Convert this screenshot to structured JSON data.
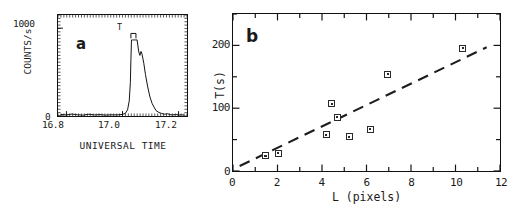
{
  "figure": {
    "background": "#ffffff",
    "ink": "#1a1a1a"
  },
  "panel_a": {
    "letter": "a",
    "peak_marker_label": "T",
    "axis_title_y": "COUNTS/s",
    "axis_title_x": "UNIVERSAL TIME",
    "ytick_labels": [
      "0",
      "1000"
    ],
    "xtick_labels": [
      "16.8",
      "17.0",
      "17.2"
    ],
    "chart_data": {
      "type": "line",
      "title": "",
      "xlabel": "UNIVERSAL TIME",
      "ylabel": "COUNTS/s",
      "xlim": [
        16.77,
        17.23
      ],
      "ylim": [
        0,
        1150
      ],
      "xticks": [
        16.8,
        17.0,
        17.2
      ],
      "yticks": [
        0,
        1000
      ],
      "grid": false,
      "legend": "none",
      "annotations": [
        {
          "text": "T",
          "x": 17.04,
          "y": 990,
          "note": "bracket spanning flat-topped burst"
        }
      ],
      "series": [
        {
          "name": "count rate",
          "note": "noisy baseline with sharp flat-topped step and smooth secondary peak",
          "x": [
            16.78,
            16.8,
            16.82,
            16.84,
            16.86,
            16.88,
            16.9,
            16.92,
            16.94,
            16.96,
            16.98,
            17.0,
            17.01,
            17.018,
            17.024,
            17.028,
            17.03,
            17.032,
            17.036,
            17.04,
            17.046,
            17.052,
            17.058,
            17.062,
            17.066,
            17.07,
            17.076,
            17.082,
            17.09,
            17.098,
            17.106,
            17.114,
            17.12,
            17.13,
            17.14,
            17.15,
            17.16,
            17.17,
            17.18,
            17.19,
            17.2,
            17.21,
            17.22
          ],
          "y": [
            18,
            12,
            22,
            14,
            10,
            20,
            12,
            16,
            10,
            14,
            12,
            18,
            30,
            70,
            170,
            380,
            640,
            866,
            866,
            866,
            866,
            866,
            730,
            690,
            735,
            700,
            600,
            470,
            330,
            215,
            140,
            92,
            60,
            40,
            28,
            20,
            26,
            16,
            12,
            18,
            10,
            14,
            10
          ]
        }
      ]
    }
  },
  "panel_b": {
    "letter": "b",
    "axis_title_y": "T(s)",
    "axis_title_x": "L (pixels)",
    "ytick_labels": [
      "0",
      "100",
      "200"
    ],
    "xtick_labels": [
      "0",
      "2",
      "4",
      "6",
      "8",
      "10",
      "12"
    ],
    "chart_data": {
      "type": "scatter",
      "title": "",
      "xlabel": "L (pixels)",
      "ylabel": "T(s)",
      "xlim": [
        0,
        12
      ],
      "ylim": [
        0,
        250
      ],
      "xticks": [
        0,
        2,
        4,
        6,
        8,
        10,
        12
      ],
      "yticks": [
        0,
        100,
        200
      ],
      "minor_xticks": [
        1,
        3,
        5,
        7,
        9,
        11
      ],
      "minor_yticks": [
        50,
        150,
        250
      ],
      "grid": false,
      "legend": "none",
      "marker_style": "open-square-with-center-dot",
      "points": [
        {
          "x": 1.45,
          "y": 27
        },
        {
          "x": 2.02,
          "y": 31
        },
        {
          "x": 4.15,
          "y": 60
        },
        {
          "x": 4.4,
          "y": 109
        },
        {
          "x": 4.65,
          "y": 88
        },
        {
          "x": 5.18,
          "y": 57
        },
        {
          "x": 6.12,
          "y": 69
        },
        {
          "x": 6.9,
          "y": 155
        },
        {
          "x": 10.25,
          "y": 196
        }
      ],
      "trendline": {
        "style": "dashed",
        "x_start": 0.3,
        "y_start": 8,
        "x_end": 11.4,
        "y_end": 197
      }
    }
  }
}
